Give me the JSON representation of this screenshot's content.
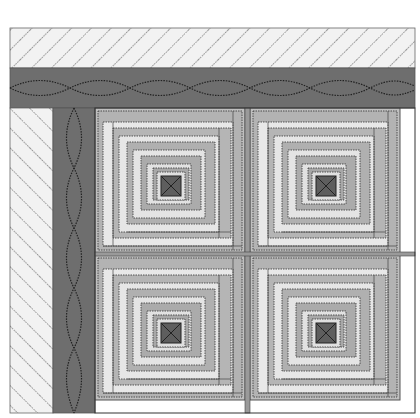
{
  "illustration": {
    "subject": "Log cabin quilt corner with borders",
    "colors": {
      "background": "#ffffff",
      "outer_border": "#f1f1f1",
      "hatch": "#333333",
      "inner_border": "#6e6e6e",
      "light_fabric": "#e6e6e6",
      "mid_fabric": "#b5b5b5",
      "dark_fabric": "#8a8a8a",
      "center_square": "#5e5e5e",
      "stitch": "#222222"
    },
    "blocks": [
      {
        "id": "top-left",
        "x": 95,
        "y": 108
      },
      {
        "id": "top-right",
        "x": 250,
        "y": 108
      },
      {
        "id": "bottom-left",
        "x": 95,
        "y": 255
      },
      {
        "id": "bottom-right",
        "x": 250,
        "y": 255
      }
    ]
  }
}
